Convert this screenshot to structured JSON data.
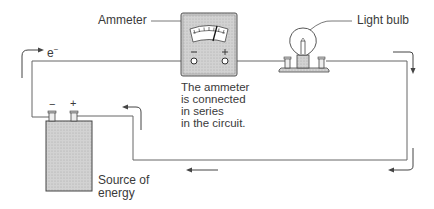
{
  "labels": {
    "ammeter": "Ammeter",
    "light_bulb": "Light bulb",
    "electron": "e",
    "electron_charge": "−",
    "note_line1": "The ammeter",
    "note_line2": "is connected",
    "note_line3": "in series",
    "note_line4": "in the circuit.",
    "source_line1": "Source of",
    "source_line2": "energy",
    "ammeter_minus": "−",
    "ammeter_plus": "+",
    "battery_minus": "−",
    "battery_plus": "+"
  },
  "colors": {
    "line": "#555555",
    "fill_gray": "#c8c8c8",
    "text": "#3a3a3a"
  }
}
